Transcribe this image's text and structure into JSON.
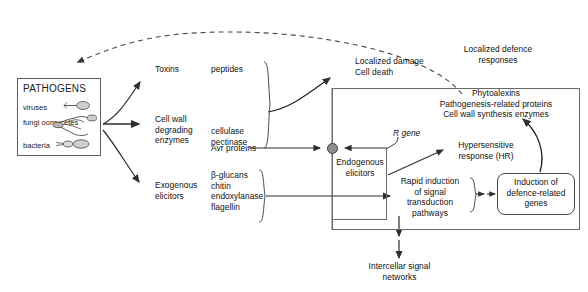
{
  "pathogens": {
    "heading": "PATHOGENS",
    "items": [
      {
        "label": "viruses",
        "icon": "virus-particle-icon"
      },
      {
        "label": "fungi\noomycetes",
        "icon": "fungal-hyphae-icon"
      },
      {
        "label": "bacteria",
        "icon": "bacteria-rod-icon"
      }
    ]
  },
  "outputs": {
    "toxins": "Toxins",
    "cell_wall_enzymes": "Cell wall\ndegrading\nenzymes",
    "exogenous_elicitors": "Exogenous\nelicitors"
  },
  "molecules": {
    "peptides": "peptides",
    "cellulase_pectinase": "cellulase\npectinase",
    "avr_proteins": "Avr proteins",
    "elicitor_list": "β-glucans\nchitin\nendoxylanase\nflagellin"
  },
  "damage": {
    "localized_damage": "Localized damage\nCell death",
    "localized_defence": "Localized defence\nresponses"
  },
  "panel": {
    "products": "Phytoalexins\nPathogenesis-related proteins\nCell wall synthesis enzymes",
    "r_gene": "R gene",
    "r_gene_italic_part": "R",
    "endogenous_elicitors": "Endogenous\nelicitors",
    "hypersensitive_response": "Hypersensitive\nresponse (HR)",
    "rapid_induction": "Rapid induction\nof signal\ntransduction\npathways",
    "induction_defence_genes": "Induction of\ndefence-related\ngenes"
  },
  "bottom": {
    "intercellar_signal": "Intercellar signal\nnetworks"
  },
  "colors": {
    "line": "#3a3a3a",
    "panel_border": "#6a6a6a",
    "node_fill": "#8e8e8e",
    "dashed_line": "#4a4a4a",
    "text": "#111111",
    "background": "#ffffff"
  }
}
